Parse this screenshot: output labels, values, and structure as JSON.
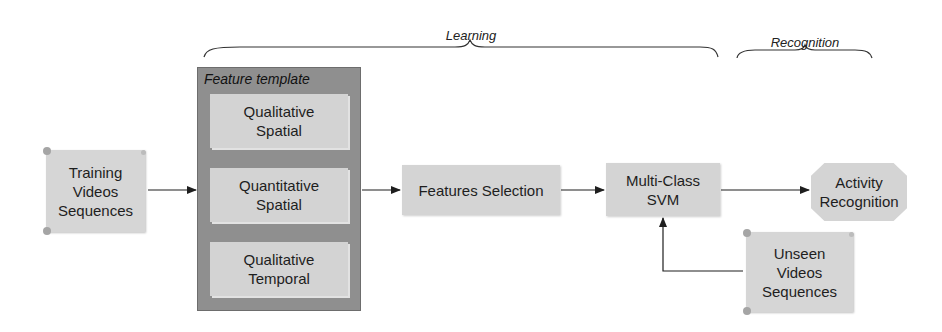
{
  "diagram": {
    "phases": {
      "learning": {
        "label": "Learning"
      },
      "recognition": {
        "label": "Recognition"
      }
    },
    "nodes": {
      "training": {
        "label": "Training\nVideos\nSequences",
        "shape": "scroll"
      },
      "feature_template": {
        "title": "Feature template",
        "items": [
          {
            "label": "Qualitative\nSpatial"
          },
          {
            "label": "Quantitative\nSpatial"
          },
          {
            "label": "Qualitative\nTemporal"
          }
        ]
      },
      "features_selection": {
        "label": "Features Selection",
        "shape": "rectangle"
      },
      "svm": {
        "label": "Multi-Class\nSVM",
        "shape": "rectangle"
      },
      "activity_recognition": {
        "label": "Activity\nRecognition",
        "shape": "octagon"
      },
      "unseen": {
        "label": "Unseen\nVideos\nSequences",
        "shape": "scroll"
      }
    },
    "edges": [
      {
        "from": "Training Videos Sequences",
        "to": "Feature template"
      },
      {
        "from": "Feature template",
        "to": "Features Selection"
      },
      {
        "from": "Features Selection",
        "to": "Multi-Class SVM"
      },
      {
        "from": "Multi-Class SVM",
        "to": "Activity Recognition"
      },
      {
        "from": "Unseen Videos Sequences",
        "to": "Multi-Class SVM"
      }
    ],
    "colors": {
      "node_fill": "#d4d4d4",
      "template_fill": "#8f8f8f",
      "line": "#222222"
    }
  }
}
